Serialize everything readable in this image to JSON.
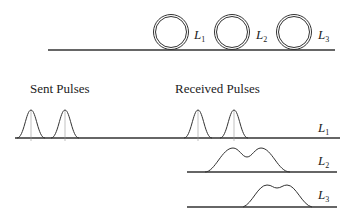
{
  "fiber": {
    "loops": [
      {
        "label": "L",
        "sub": "1"
      },
      {
        "label": "L",
        "sub": "2"
      },
      {
        "label": "L",
        "sub": "3"
      }
    ]
  },
  "headings": {
    "sent": "Sent Pulses",
    "received": "Received Pulses"
  },
  "rows": [
    {
      "label": "L",
      "sub": "1",
      "description": "two separated Gaussian pulses"
    },
    {
      "label": "L",
      "sub": "2",
      "description": "broadened, overlapping pulses"
    },
    {
      "label": "L",
      "sub": "3",
      "description": "further broadened, delayed pulses"
    }
  ],
  "colors": {
    "line": "#333333",
    "marker": "#999999",
    "text": "#222222"
  }
}
